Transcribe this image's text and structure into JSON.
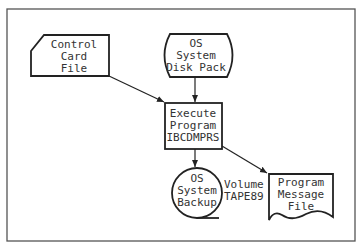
{
  "diagram": {
    "type": "flowchart",
    "nodes": {
      "control_card": {
        "shape": "punched-card",
        "lines": [
          "Control",
          "Card",
          "File"
        ]
      },
      "disk_pack": {
        "shape": "stored-data",
        "lines": [
          "OS",
          "System",
          "Disk Pack"
        ]
      },
      "execute": {
        "shape": "process",
        "lines": [
          "Execute",
          "Program",
          "IBCDMPRS"
        ]
      },
      "backup": {
        "shape": "magnetic-tape",
        "lines": [
          "OS",
          "System",
          "Backup"
        ]
      },
      "message_file": {
        "shape": "document",
        "lines": [
          "Program",
          "Message",
          "File"
        ]
      }
    },
    "annotations": {
      "volume": [
        "Volume",
        "TAPE89"
      ]
    },
    "edges": [
      {
        "from": "control_card",
        "to": "execute"
      },
      {
        "from": "disk_pack",
        "to": "execute"
      },
      {
        "from": "execute",
        "to": "backup"
      },
      {
        "from": "execute",
        "to": "message_file"
      }
    ],
    "colors": {
      "stroke": "#222222",
      "frame": "#555555",
      "text": "#333333"
    }
  }
}
